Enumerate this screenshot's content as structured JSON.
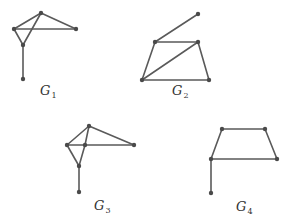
{
  "figure": {
    "colors": {
      "edge": "#5a5a5a",
      "vertex": "#4a4a4a",
      "text": "#333333",
      "background": "#ffffff"
    },
    "graphs": [
      {
        "id": "G1",
        "label_main": "G",
        "label_sub": "1",
        "label_pos": [
          40,
          95
        ],
        "vertices": [
          [
            41,
            13
          ],
          [
            14,
            29
          ],
          [
            76,
            29
          ],
          [
            23,
            45
          ],
          [
            23,
            79
          ]
        ],
        "edges": [
          [
            0,
            1
          ],
          [
            0,
            2
          ],
          [
            1,
            2
          ],
          [
            1,
            3
          ],
          [
            0,
            3
          ],
          [
            3,
            4
          ]
        ]
      },
      {
        "id": "G2",
        "label_main": "G",
        "label_sub": "2",
        "label_pos": [
          172,
          95
        ],
        "vertices": [
          [
            198,
            14
          ],
          [
            155,
            42
          ],
          [
            198,
            42
          ],
          [
            142,
            80
          ],
          [
            209,
            80
          ]
        ],
        "edges": [
          [
            0,
            1
          ],
          [
            1,
            2
          ],
          [
            1,
            3
          ],
          [
            2,
            3
          ],
          [
            2,
            4
          ],
          [
            3,
            4
          ]
        ]
      },
      {
        "id": "G3",
        "label_main": "G",
        "label_sub": "3",
        "label_pos": [
          94,
          210
        ],
        "vertices": [
          [
            89,
            126
          ],
          [
            67,
            145
          ],
          [
            85,
            145
          ],
          [
            134,
            145
          ],
          [
            79,
            166
          ],
          [
            79,
            192
          ]
        ],
        "edges": [
          [
            0,
            1
          ],
          [
            0,
            3
          ],
          [
            1,
            2
          ],
          [
            2,
            3
          ],
          [
            0,
            2
          ],
          [
            2,
            4
          ],
          [
            1,
            4
          ],
          [
            4,
            5
          ]
        ]
      },
      {
        "id": "G4",
        "label_main": "G",
        "label_sub": "4",
        "label_pos": [
          236,
          211
        ],
        "vertices": [
          [
            222,
            129
          ],
          [
            265,
            129
          ],
          [
            211,
            159
          ],
          [
            277,
            159
          ],
          [
            211,
            193
          ]
        ],
        "edges": [
          [
            0,
            1
          ],
          [
            0,
            2
          ],
          [
            1,
            3
          ],
          [
            2,
            3
          ],
          [
            2,
            4
          ]
        ]
      }
    ]
  }
}
